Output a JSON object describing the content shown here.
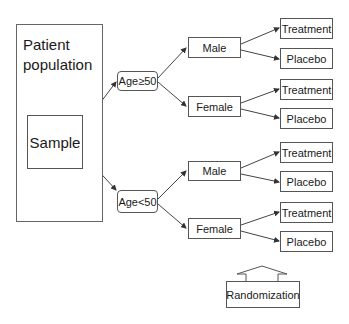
{
  "diagram": {
    "population": {
      "label_line1": "Patient",
      "label_line2": "population"
    },
    "sample": {
      "label": "Sample"
    },
    "age_groups": [
      {
        "label": "Age≥50"
      },
      {
        "label": "Age<50"
      }
    ],
    "sex_groups": [
      {
        "label": "Male"
      },
      {
        "label": "Female"
      },
      {
        "label": "Male"
      },
      {
        "label": "Female"
      }
    ],
    "arms": [
      {
        "label": "Treatment"
      },
      {
        "label": "Placebo"
      },
      {
        "label": "Treatment"
      },
      {
        "label": "Placebo"
      },
      {
        "label": "Treatment"
      },
      {
        "label": "Placebo"
      },
      {
        "label": "Treatment"
      },
      {
        "label": "Placebo"
      }
    ],
    "randomization": {
      "label": "Randomization"
    },
    "colors": {
      "stroke": "#555555",
      "text": "#1a1a1a",
      "background": "#ffffff"
    }
  }
}
